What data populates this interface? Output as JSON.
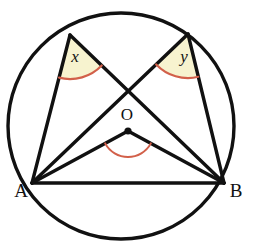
{
  "figure": {
    "kind": "circle-geometry-diagram",
    "canvas": {
      "width": 256,
      "height": 251,
      "background": "#ffffff"
    },
    "colors": {
      "line": "#111111",
      "arc_mark": "#d2604a",
      "wedge_fill": "#f7f3cf",
      "vertex_dot": "#111111",
      "background": "#ffffff"
    },
    "circle": {
      "name": "circumcircle",
      "cx": 121,
      "cy": 126,
      "r": 113,
      "stroke_width": 3.4
    },
    "points": {
      "A": {
        "label": "A",
        "x": 32,
        "y": 183,
        "label_x": 21,
        "label_y": 193
      },
      "B": {
        "label": "B",
        "x": 224,
        "y": 183,
        "label_x": 236,
        "label_y": 193
      },
      "C": {
        "label": "",
        "x": 70,
        "y": 35
      },
      "D": {
        "label": "",
        "x": 188,
        "y": 34
      },
      "O": {
        "label": "O",
        "x": 128,
        "y": 131,
        "label_x": 127,
        "label_y": 116,
        "dot_r": 3.6
      }
    },
    "segments": [
      {
        "name": "chord-AB",
        "from": "A",
        "to": "B",
        "stroke_width": 3.4
      },
      {
        "name": "chord-AC",
        "from": "A",
        "to": "C",
        "stroke_width": 3.4
      },
      {
        "name": "chord-CB",
        "from": "C",
        "to": "B",
        "stroke_width": 3.4
      },
      {
        "name": "chord-AD",
        "from": "A",
        "to": "D",
        "stroke_width": 3.4
      },
      {
        "name": "chord-DB",
        "from": "D",
        "to": "B",
        "stroke_width": 3.4
      },
      {
        "name": "radius-OA",
        "from": "O",
        "to": "A",
        "stroke_width": 3.4
      },
      {
        "name": "radius-OB",
        "from": "O",
        "to": "B",
        "stroke_width": 3.4
      }
    ],
    "angles": [
      {
        "name": "angle-x",
        "label": "x",
        "vertex": "C",
        "arm_from": "A",
        "arm_to": "B",
        "radius": 44,
        "filled": true,
        "label_x": 75,
        "label_y": 58
      },
      {
        "name": "angle-y",
        "label": "y",
        "vertex": "D",
        "arm_from": "A",
        "arm_to": "B",
        "radius": 44,
        "filled": true,
        "label_x": 184,
        "label_y": 58
      },
      {
        "name": "angle-centre-AOB",
        "label": "",
        "vertex": "O",
        "arm_from": "A",
        "arm_to": "B",
        "radius": 26,
        "filled": false,
        "label_x": 128,
        "label_y": 162
      }
    ]
  }
}
